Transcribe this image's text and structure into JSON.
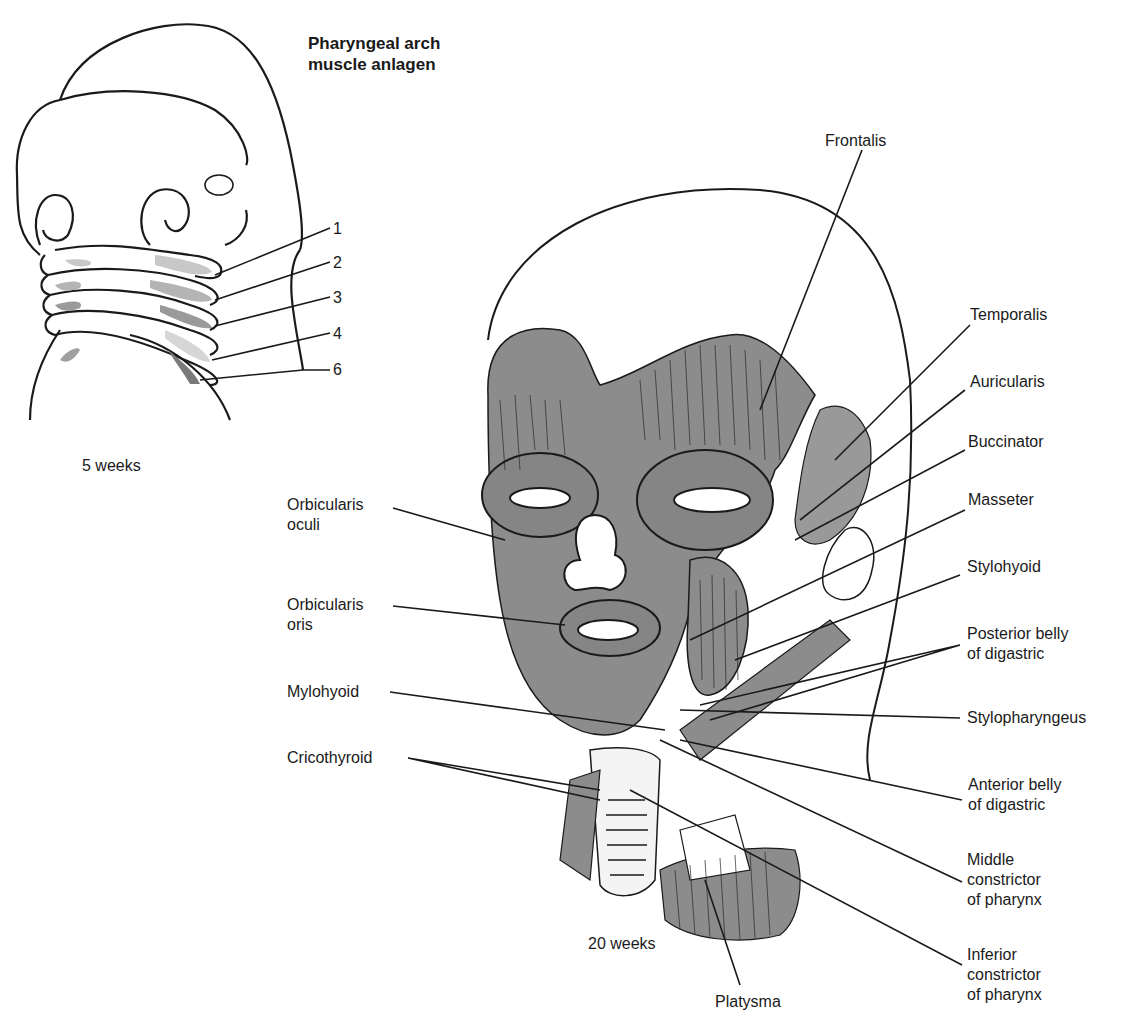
{
  "figure": {
    "panel_5wk": {
      "title": "Pharyngeal arch\nmuscle anlagen",
      "caption": "5 weeks",
      "arch_labels": [
        "1",
        "2",
        "3",
        "4",
        "6"
      ]
    },
    "panel_20wk": {
      "caption": "20 weeks",
      "labels_left": [
        "Orbicularis\noculi",
        "Orbicularis\noris",
        "Mylohyoid",
        "Cricothyroid"
      ],
      "labels_right": [
        "Frontalis",
        "Temporalis",
        "Auricularis",
        "Buccinator",
        "Masseter",
        "Stylohyoid",
        "Posterior belly\nof digastric",
        "Stylopharyngeus",
        "Anterior belly\nof digastric",
        "Middle\nconstrictor\nof pharynx",
        "Inferior\nconstrictor\nof pharynx"
      ],
      "label_bottom": "Platysma"
    },
    "colors": {
      "muscle_fill": "#8c8c8c",
      "anlagen_light": "#c8c8c8",
      "anlagen_dark": "#9a9a9a",
      "line": "#1a1a1a"
    }
  }
}
